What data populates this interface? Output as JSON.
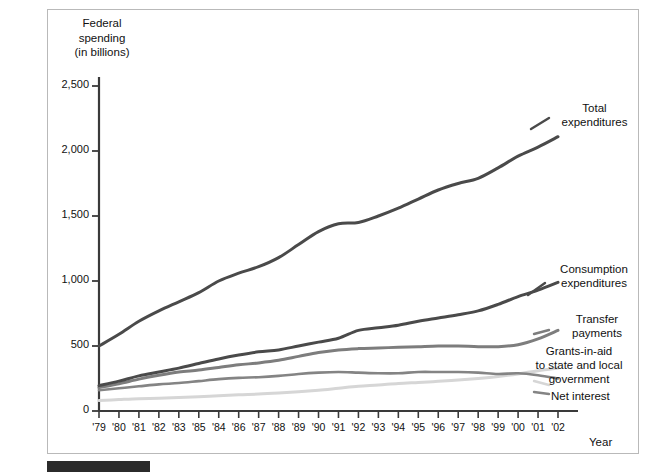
{
  "figure": {
    "background": "#ffffff",
    "frame_color": "#b9b9b9",
    "caption_bar_color": "#2b2b2b"
  },
  "axis": {
    "y_title_line1": "Federal",
    "y_title_line2": "spending",
    "y_title_line3": "(in billions)",
    "x_title": "Year",
    "y_ticks": [
      "0",
      "500",
      "1,000",
      "1,500",
      "2,000",
      "2,500"
    ],
    "x_ticks": [
      "'79",
      "'80",
      "'81",
      "'82",
      "'83",
      "'85",
      "'84",
      "'86",
      "'87",
      "'88",
      "'89",
      "'90",
      "'91",
      "'92",
      "'93",
      "'94",
      "'95",
      "'96",
      "'97",
      "'98",
      "'99",
      "'00",
      "'01",
      "'02"
    ]
  },
  "labels": {
    "total_line1": "Total",
    "total_line2": "expenditures",
    "consumption_line1": "Consumption",
    "consumption_line2": "expenditures",
    "transfer_line1": "Transfer",
    "transfer_line2": "payments",
    "grants_line1": "Grants-in-aid",
    "grants_line2": "to state and local",
    "grants_line3": "government",
    "net_interest": "Net interest"
  },
  "chart_data": {
    "type": "line",
    "title": "",
    "xlabel": "Year",
    "ylabel": "Federal spending (in billions)",
    "ylim": [
      0,
      2700
    ],
    "xlim": [
      1979,
      2002
    ],
    "grid": false,
    "legend": "inline-right-labels",
    "y_ticks": [
      0,
      500,
      1000,
      1500,
      2000,
      2500
    ],
    "categories": [
      "'79",
      "'80",
      "'81",
      "'82",
      "'83",
      "'85",
      "'84",
      "'86",
      "'87",
      "'88",
      "'89",
      "'90",
      "'91",
      "'92",
      "'93",
      "'94",
      "'95",
      "'96",
      "'97",
      "'98",
      "'99",
      "'00",
      "'01",
      "'02"
    ],
    "x": [
      1979,
      1980,
      1981,
      1982,
      1983,
      1984,
      1985,
      1986,
      1987,
      1988,
      1989,
      1990,
      1991,
      1992,
      1993,
      1994,
      1995,
      1996,
      1997,
      1998,
      1999,
      2000,
      2001,
      2002
    ],
    "series": [
      {
        "name": "Total expenditures",
        "color": "#4a4a4a",
        "width": 3.0,
        "values": [
          500,
          590,
          690,
          770,
          840,
          910,
          1000,
          1060,
          1110,
          1180,
          1280,
          1380,
          1440,
          1450,
          1500,
          1560,
          1630,
          1700,
          1750,
          1790,
          1870,
          1960,
          2030,
          2110
        ]
      },
      {
        "name": "Consumption expenditures",
        "color": "#4a4a4a",
        "width": 3.0,
        "values": [
          195,
          230,
          270,
          300,
          330,
          365,
          400,
          430,
          455,
          470,
          500,
          530,
          560,
          620,
          640,
          660,
          690,
          715,
          740,
          770,
          820,
          880,
          930,
          990
        ]
      },
      {
        "name": "Transfer payments",
        "color": "#7d7d7d",
        "width": 3.0,
        "values": [
          180,
          210,
          245,
          275,
          300,
          315,
          335,
          355,
          370,
          390,
          420,
          450,
          470,
          480,
          485,
          490,
          495,
          500,
          500,
          495,
          495,
          510,
          555,
          620
        ]
      },
      {
        "name": "Net interest",
        "color": "#848484",
        "width": 2.6,
        "values": [
          160,
          175,
          190,
          205,
          215,
          230,
          245,
          255,
          260,
          270,
          285,
          295,
          300,
          295,
          290,
          290,
          300,
          300,
          300,
          295,
          285,
          290,
          275,
          250
        ]
      },
      {
        "name": "Grants-in-aid to state and local government",
        "color": "#d6d6d6",
        "width": 3.0,
        "values": [
          80,
          88,
          95,
          98,
          104,
          110,
          118,
          125,
          130,
          138,
          148,
          160,
          175,
          190,
          200,
          212,
          220,
          228,
          238,
          250,
          265,
          285,
          310,
          330
        ]
      }
    ]
  }
}
